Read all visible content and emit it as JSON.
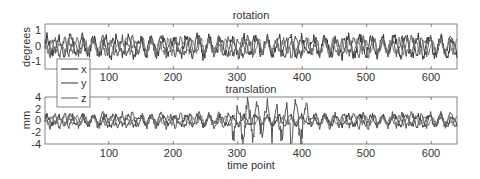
{
  "chart_data": [
    {
      "type": "line",
      "title": "rotation",
      "xlabel": "",
      "ylabel": "degrees",
      "xlim": [
        1,
        640
      ],
      "ylim": [
        -1.5,
        1.5
      ],
      "xticks": [
        100,
        200,
        300,
        400,
        500,
        600
      ],
      "yticks": [
        -1,
        0,
        1
      ],
      "grid": false,
      "series": [
        {
          "name": "x",
          "amplitude": 0.6,
          "note": "oscillating around 0, peaks up to ~1.2"
        },
        {
          "name": "y",
          "amplitude": 0.5,
          "note": "oscillating around 0"
        },
        {
          "name": "z",
          "amplitude": 0.4,
          "note": "oscillating around 0, dip near t=420 to ~-1.3"
        }
      ],
      "legend": {
        "entries": [
          "x",
          "y",
          "z"
        ],
        "position": "lower left"
      }
    },
    {
      "type": "line",
      "title": "translation",
      "xlabel": "time point",
      "ylabel": "mm",
      "xlim": [
        1,
        640
      ],
      "ylim": [
        -4,
        4
      ],
      "xticks": [
        100,
        200,
        300,
        400,
        500,
        600
      ],
      "yticks": [
        -4,
        -2,
        0,
        2,
        4
      ],
      "grid": false,
      "series": [
        {
          "name": "x",
          "amplitude": 0.8,
          "note": "oscillating around 0"
        },
        {
          "name": "y",
          "amplitude": 1.0,
          "note": "larger peaks ~2.5-3 between t=300 and t=410"
        },
        {
          "name": "z",
          "amplitude": 0.6,
          "note": "oscillating around 0"
        }
      ]
    }
  ],
  "top": {
    "title": "rotation",
    "ylabel": "degrees",
    "yticks": [
      "1",
      "0",
      "-1"
    ]
  },
  "bottom": {
    "title": "translation",
    "ylabel": "mm",
    "xlabel": "time point",
    "yticks": [
      "4",
      "2",
      "0",
      "-2",
      "-4"
    ]
  },
  "xticks": [
    "100",
    "200",
    "300",
    "400",
    "500",
    "600"
  ],
  "legend": [
    "x",
    "y",
    "z"
  ]
}
